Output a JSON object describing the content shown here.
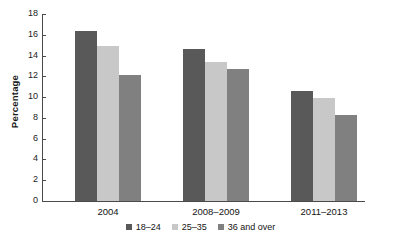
{
  "chart_data": {
    "type": "bar",
    "title": "",
    "subtitle": "",
    "xlabel": "",
    "ylabel": "Percentage",
    "categories": [
      "2004",
      "2008–2009",
      "2011–2013"
    ],
    "series": [
      {
        "name": "18–24",
        "color": "#595959",
        "values": [
          16.4,
          14.6,
          10.6
        ]
      },
      {
        "name": "25–35",
        "color": "#c8c8c8",
        "values": [
          14.9,
          13.4,
          9.9
        ]
      },
      {
        "name": "36 and over",
        "color": "#808080",
        "values": [
          12.1,
          12.7,
          8.3
        ]
      }
    ],
    "ylim": [
      0,
      18
    ],
    "ytick_step": 2,
    "ytick_labels": [
      "0",
      "2",
      "4",
      "6",
      "8",
      "10",
      "12",
      "14",
      "16",
      "18"
    ],
    "grid": false,
    "legend_position": "bottom",
    "annotations": []
  }
}
